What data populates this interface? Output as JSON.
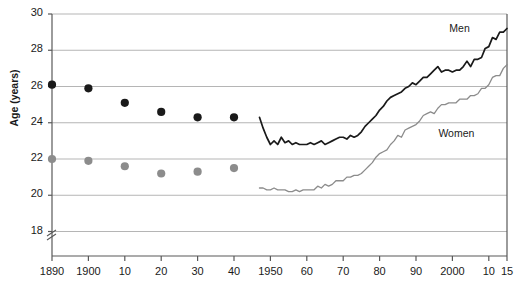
{
  "chart_data": {
    "type": "line",
    "title": "",
    "subtitle": "",
    "xlabel": "",
    "ylabel": "Age (years)",
    "ylim": [
      17.2,
      30
    ],
    "xlim": [
      1890,
      2015
    ],
    "y_ticks": [
      18,
      20,
      22,
      24,
      26,
      28,
      30
    ],
    "y_tick_labels": [
      "18",
      "20",
      "22",
      "24",
      "26",
      "28",
      "30"
    ],
    "x_ticks": [
      1890,
      1900,
      1910,
      1920,
      1930,
      1940,
      1950,
      1960,
      1970,
      1980,
      1990,
      2000,
      2010,
      2015
    ],
    "x_tick_labels": [
      "1890",
      "1900",
      "10",
      "20",
      "30",
      "40",
      "1950",
      "60",
      "70",
      "80",
      "90",
      "2000",
      "10",
      "15"
    ],
    "grid": "horizontal",
    "y_axis_break": true,
    "legend_position": "inline-annotations",
    "colors": {
      "men": "#1a1a1a",
      "women": "#8c8c8c",
      "grid": "#b5b5b5",
      "axis": "#595959"
    },
    "series": [
      {
        "name": "Men",
        "label": "Men",
        "color": "#1a1a1a",
        "marker_style": "filled-circle",
        "markers": [
          {
            "x": 1890,
            "y": 26.1
          },
          {
            "x": 1900,
            "y": 25.9
          },
          {
            "x": 1910,
            "y": 25.1
          },
          {
            "x": 1920,
            "y": 24.6
          },
          {
            "x": 1930,
            "y": 24.3
          },
          {
            "x": 1940,
            "y": 24.3
          }
        ],
        "line_x": [
          1947,
          1948,
          1949,
          1950,
          1951,
          1952,
          1953,
          1954,
          1955,
          1956,
          1957,
          1958,
          1959,
          1960,
          1961,
          1962,
          1963,
          1964,
          1965,
          1966,
          1967,
          1968,
          1969,
          1970,
          1971,
          1972,
          1973,
          1974,
          1975,
          1976,
          1977,
          1978,
          1979,
          1980,
          1981,
          1982,
          1983,
          1984,
          1985,
          1986,
          1987,
          1988,
          1989,
          1990,
          1991,
          1992,
          1993,
          1994,
          1995,
          1996,
          1997,
          1998,
          1999,
          2000,
          2001,
          2002,
          2003,
          2004,
          2005,
          2006,
          2007,
          2008,
          2009,
          2010,
          2011,
          2012,
          2013,
          2014,
          2015
        ],
        "line_y": [
          24.3,
          23.7,
          23.2,
          22.8,
          23.0,
          22.8,
          23.2,
          22.9,
          23.0,
          22.8,
          22.9,
          22.8,
          22.8,
          22.8,
          22.9,
          22.8,
          22.9,
          23.0,
          22.8,
          22.9,
          23.0,
          23.1,
          23.2,
          23.2,
          23.1,
          23.3,
          23.2,
          23.3,
          23.5,
          23.8,
          24.0,
          24.2,
          24.4,
          24.7,
          24.9,
          25.2,
          25.4,
          25.5,
          25.6,
          25.7,
          25.9,
          26.0,
          26.2,
          26.1,
          26.3,
          26.5,
          26.5,
          26.7,
          26.9,
          27.1,
          26.8,
          26.9,
          26.9,
          26.8,
          26.9,
          26.9,
          27.1,
          27.4,
          27.1,
          27.5,
          27.5,
          27.6,
          28.1,
          28.2,
          28.7,
          28.6,
          29.0,
          29.0,
          29.2
        ]
      },
      {
        "name": "Women",
        "label": "Women",
        "color": "#8c8c8c",
        "marker_style": "filled-circle",
        "markers": [
          {
            "x": 1890,
            "y": 22.0
          },
          {
            "x": 1900,
            "y": 21.9
          },
          {
            "x": 1910,
            "y": 21.6
          },
          {
            "x": 1920,
            "y": 21.2
          },
          {
            "x": 1930,
            "y": 21.3
          },
          {
            "x": 1940,
            "y": 21.5
          }
        ],
        "line_x": [
          1947,
          1948,
          1949,
          1950,
          1951,
          1952,
          1953,
          1954,
          1955,
          1956,
          1957,
          1958,
          1959,
          1960,
          1961,
          1962,
          1963,
          1964,
          1965,
          1966,
          1967,
          1968,
          1969,
          1970,
          1971,
          1972,
          1973,
          1974,
          1975,
          1976,
          1977,
          1978,
          1979,
          1980,
          1981,
          1982,
          1983,
          1984,
          1985,
          1986,
          1987,
          1988,
          1989,
          1990,
          1991,
          1992,
          1993,
          1994,
          1995,
          1996,
          1997,
          1998,
          1999,
          2000,
          2001,
          2002,
          2003,
          2004,
          2005,
          2006,
          2007,
          2008,
          2009,
          2010,
          2011,
          2012,
          2013,
          2014,
          2015
        ],
        "line_y": [
          20.4,
          20.4,
          20.3,
          20.3,
          20.4,
          20.3,
          20.3,
          20.3,
          20.2,
          20.2,
          20.3,
          20.2,
          20.3,
          20.3,
          20.3,
          20.3,
          20.5,
          20.4,
          20.6,
          20.5,
          20.6,
          20.8,
          20.8,
          20.8,
          21.0,
          21.0,
          21.1,
          21.1,
          21.2,
          21.4,
          21.6,
          21.8,
          22.1,
          22.3,
          22.4,
          22.5,
          22.8,
          23.0,
          23.3,
          23.2,
          23.6,
          23.7,
          23.8,
          23.9,
          24.1,
          24.4,
          24.5,
          24.6,
          24.5,
          24.8,
          25.0,
          25.0,
          25.1,
          25.1,
          25.1,
          25.3,
          25.3,
          25.3,
          25.5,
          25.5,
          25.6,
          25.9,
          25.9,
          26.1,
          26.5,
          26.6,
          26.6,
          27.0,
          27.2
        ]
      }
    ],
    "annotations": [
      {
        "text": "Men",
        "x": 2003,
        "y": 29.2
      },
      {
        "text": "Women",
        "x": 2000,
        "y": 23.4
      }
    ]
  },
  "axis": {
    "y_title": "Age (years)"
  }
}
